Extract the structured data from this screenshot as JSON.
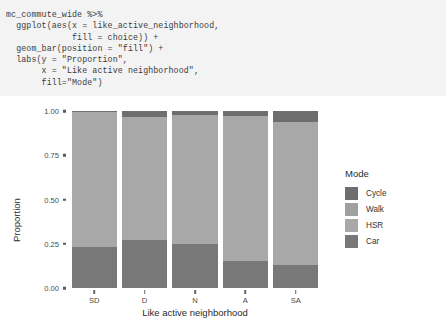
{
  "code_block": {
    "language": "r",
    "lines": [
      "mc_commute_wide %>%",
      "  ggplot(aes(x = like_active_neighborhood,",
      "             fill = choice)) +",
      "  geom_bar(position = \"fill\") +",
      "  labs(y = \"Proportion\",",
      "       x = \"Like active neighborhood\",",
      "       fill=\"Mode\")"
    ],
    "text": "mc_commute_wide %>%\n  ggplot(aes(x = like_active_neighborhood,\n             fill = choice)) +\n  geom_bar(position = \"fill\") +\n  labs(y = \"Proportion\",\n       x = \"Like active neighborhood\",\n       fill=\"Mode\")",
    "background": "#f3f3f3"
  },
  "chart_data": {
    "type": "bar",
    "stacked": true,
    "stack_mode": "fill",
    "title": "",
    "xlabel": "Like active neighborhood",
    "ylabel": "Proportion",
    "categories": [
      "SD",
      "D",
      "N",
      "A",
      "SA"
    ],
    "ylim": [
      0.0,
      1.0
    ],
    "ytick_labels": [
      "0.00",
      "0.25",
      "0.50",
      "0.75",
      "1.00"
    ],
    "ytick_values": [
      0.0,
      0.25,
      0.5,
      0.75,
      1.0
    ],
    "grid": false,
    "legend_title": "Mode",
    "legend_position": "right",
    "panel_background": "#ffffff",
    "series": [
      {
        "name": "Cycle",
        "color": "#6e6e6e",
        "values": [
          0.005,
          0.035,
          0.022,
          0.028,
          0.063
        ]
      },
      {
        "name": "Walk",
        "color": "#a0a0a0",
        "values": [
          0.0,
          0.0,
          0.0,
          0.0,
          0.0
        ]
      },
      {
        "name": "HSR",
        "color": "#a8a8a8",
        "values": [
          0.765,
          0.695,
          0.728,
          0.822,
          0.807
        ]
      },
      {
        "name": "Car",
        "color": "#787878",
        "values": [
          0.23,
          0.27,
          0.25,
          0.15,
          0.13
        ]
      }
    ],
    "stack_order_bottom_to_top": [
      "Car",
      "HSR",
      "Walk",
      "Cycle"
    ]
  },
  "legend": {
    "title": "Mode",
    "items": [
      {
        "label": "Cycle",
        "color": "#6e6e6e"
      },
      {
        "label": "Walk",
        "color": "#a0a0a0"
      },
      {
        "label": "HSR",
        "color": "#a8a8a8"
      },
      {
        "label": "Car",
        "color": "#787878"
      }
    ]
  }
}
